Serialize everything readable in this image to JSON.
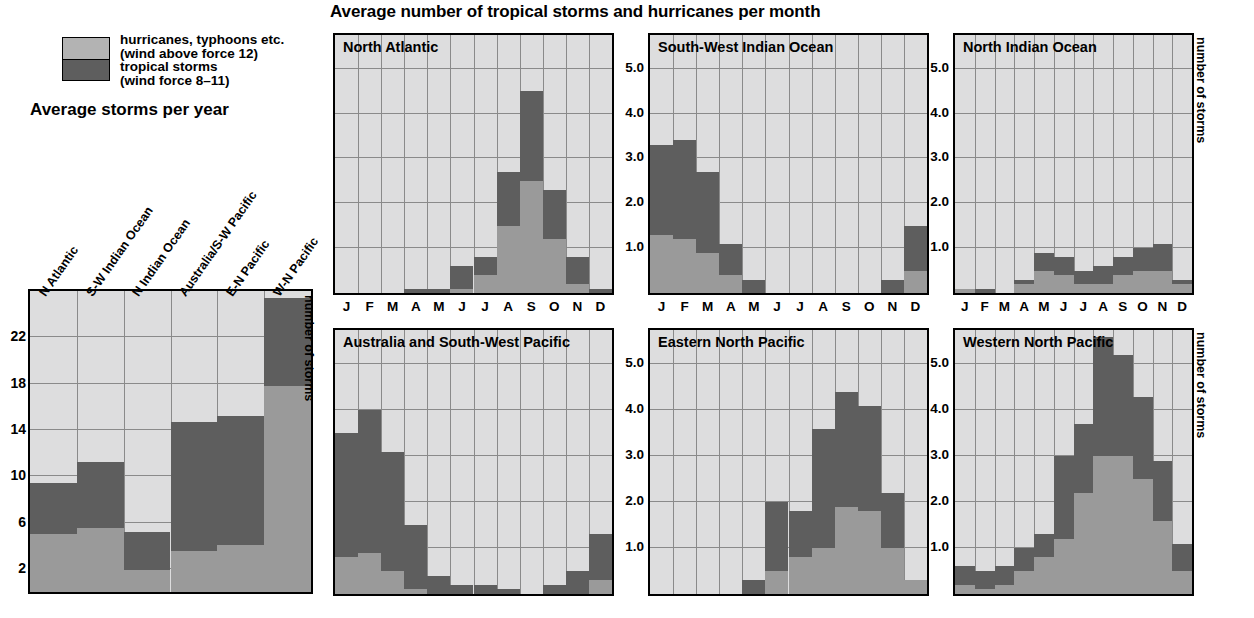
{
  "title": "Average number of tropical storms and hurricanes per month",
  "legend": {
    "items": [
      {
        "label_line1": "hurricanes, typhoons etc.",
        "label_line2": "(wind above force 12)",
        "color": "#b3b3b3",
        "key": "hurricanes"
      },
      {
        "label_line1": "tropical storms",
        "label_line2": "(wind force 8–11)",
        "color": "#5e5e5e",
        "key": "storms"
      }
    ]
  },
  "left_chart_title": "Average storms per year",
  "axis_label_right": "number of storms",
  "months": [
    "J",
    "F",
    "M",
    "A",
    "M",
    "J",
    "J",
    "A",
    "S",
    "O",
    "N",
    "D"
  ],
  "chart_data": [
    {
      "type": "bar",
      "title": "Average storms per year",
      "subtype": "stacked-bar",
      "xlabel": "",
      "ylabel": "number of storms",
      "ylim": [
        0,
        26
      ],
      "yticks": [
        2,
        6,
        10,
        14,
        18,
        22
      ],
      "grid": true,
      "categories": [
        "N Atlantic",
        "S-W Indian Ocean",
        "N Indian Ocean",
        "Australia/S-W Pacific",
        "E-N Pacific",
        "W-N Pacific"
      ],
      "series": [
        {
          "name": "hurricanes, typhoons etc. (wind above force 12)",
          "color": "#9a9a9a",
          "values": [
            5.0,
            5.5,
            1.9,
            3.5,
            4.1,
            17.8
          ]
        },
        {
          "name": "tropical storms (wind force 8-11)",
          "color": "#5e5e5e",
          "values": [
            4.4,
            5.7,
            3.3,
            11.2,
            11.1,
            7.6
          ]
        }
      ],
      "totals": [
        9.4,
        11.2,
        5.2,
        14.7,
        15.2,
        25.4
      ]
    },
    {
      "type": "bar",
      "subtype": "stacked-bar",
      "title": "North Atlantic",
      "xlabel": "",
      "ylabel": "number of storms",
      "ylim": [
        0,
        5.75
      ],
      "yticks": [
        1.0,
        2.0,
        3.0,
        4.0,
        5.0
      ],
      "grid": true,
      "categories": [
        "J",
        "F",
        "M",
        "A",
        "M",
        "J",
        "J",
        "A",
        "S",
        "O",
        "N",
        "D"
      ],
      "series": [
        {
          "name": "hurricanes, typhoons etc. (wind above force 12)",
          "color": "#9a9a9a",
          "values": [
            0.0,
            0.0,
            0.0,
            0.0,
            0.0,
            0.1,
            0.4,
            1.5,
            2.5,
            1.2,
            0.2,
            0.0
          ]
        },
        {
          "name": "tropical storms (wind force 8-11)",
          "color": "#5e5e5e",
          "values": [
            0.0,
            0.0,
            0.0,
            0.1,
            0.1,
            0.5,
            0.4,
            1.2,
            2.0,
            1.1,
            0.6,
            0.1
          ]
        }
      ],
      "totals": [
        0.0,
        0.0,
        0.0,
        0.1,
        0.1,
        0.6,
        0.8,
        2.7,
        4.5,
        2.3,
        0.8,
        0.1
      ]
    },
    {
      "type": "bar",
      "subtype": "stacked-bar",
      "title": "South-West Indian Ocean",
      "xlabel": "",
      "ylabel": "number of storms",
      "ylim": [
        0,
        5.75
      ],
      "yticks": [
        1.0,
        2.0,
        3.0,
        4.0,
        5.0
      ],
      "grid": true,
      "categories": [
        "J",
        "F",
        "M",
        "A",
        "M",
        "J",
        "J",
        "A",
        "S",
        "O",
        "N",
        "D"
      ],
      "series": [
        {
          "name": "hurricanes, typhoons etc. (wind above force 12)",
          "color": "#9a9a9a",
          "values": [
            1.3,
            1.2,
            0.9,
            0.4,
            0.0,
            0.0,
            0.0,
            0.0,
            0.0,
            0.0,
            0.0,
            0.5
          ]
        },
        {
          "name": "tropical storms (wind force 8-11)",
          "color": "#5e5e5e",
          "values": [
            2.0,
            2.2,
            1.8,
            0.7,
            0.3,
            0.0,
            0.0,
            0.0,
            0.0,
            0.0,
            0.3,
            1.0
          ]
        }
      ],
      "totals": [
        3.3,
        3.4,
        2.7,
        1.1,
        0.3,
        0.0,
        0.0,
        0.0,
        0.0,
        0.0,
        0.3,
        1.5
      ]
    },
    {
      "type": "bar",
      "subtype": "stacked-bar",
      "title": "North Indian Ocean",
      "xlabel": "",
      "ylabel": "number of storms",
      "ylim": [
        0,
        5.75
      ],
      "yticks": [
        1.0,
        2.0,
        3.0,
        4.0,
        5.0
      ],
      "grid": true,
      "categories": [
        "J",
        "F",
        "M",
        "A",
        "M",
        "J",
        "J",
        "A",
        "S",
        "O",
        "N",
        "D"
      ],
      "series": [
        {
          "name": "hurricanes, typhoons etc. (wind above force 12)",
          "color": "#9a9a9a",
          "values": [
            0.1,
            0.0,
            0.0,
            0.2,
            0.5,
            0.4,
            0.2,
            0.2,
            0.4,
            0.5,
            0.5,
            0.2
          ]
        },
        {
          "name": "tropical storms (wind force 8-11)",
          "color": "#5e5e5e",
          "values": [
            0.0,
            0.1,
            0.0,
            0.1,
            0.4,
            0.4,
            0.3,
            0.4,
            0.4,
            0.5,
            0.6,
            0.1
          ]
        }
      ],
      "totals": [
        0.1,
        0.1,
        0.0,
        0.3,
        0.9,
        0.8,
        0.5,
        0.6,
        0.8,
        1.0,
        1.1,
        0.3
      ]
    },
    {
      "type": "bar",
      "subtype": "stacked-bar",
      "title": "Australia and South-West Pacific",
      "xlabel": "",
      "ylabel": "number of storms",
      "ylim": [
        0,
        5.75
      ],
      "yticks": [
        1.0,
        2.0,
        3.0,
        4.0,
        5.0
      ],
      "grid": true,
      "categories": [
        "J",
        "F",
        "M",
        "A",
        "M",
        "J",
        "J",
        "A",
        "S",
        "O",
        "N",
        "D"
      ],
      "series": [
        {
          "name": "hurricanes, typhoons etc. (wind above force 12)",
          "color": "#9a9a9a",
          "values": [
            0.8,
            0.9,
            0.5,
            0.1,
            0.0,
            0.0,
            0.0,
            0.0,
            0.0,
            0.0,
            0.0,
            0.3
          ]
        },
        {
          "name": "tropical storms (wind force 8-11)",
          "color": "#5e5e5e",
          "values": [
            2.7,
            3.1,
            2.6,
            1.4,
            0.4,
            0.2,
            0.2,
            0.1,
            0.0,
            0.2,
            0.5,
            1.0
          ]
        }
      ],
      "totals": [
        3.5,
        4.0,
        3.1,
        1.5,
        0.4,
        0.2,
        0.2,
        0.1,
        0.0,
        0.2,
        0.5,
        1.3
      ]
    },
    {
      "type": "bar",
      "subtype": "stacked-bar",
      "title": "Eastern North Pacific",
      "xlabel": "",
      "ylabel": "number of storms",
      "ylim": [
        0,
        5.75
      ],
      "yticks": [
        1.0,
        2.0,
        3.0,
        4.0,
        5.0
      ],
      "grid": true,
      "categories": [
        "J",
        "F",
        "M",
        "A",
        "M",
        "J",
        "J",
        "A",
        "S",
        "O",
        "N",
        "D"
      ],
      "series": [
        {
          "name": "hurricanes, typhoons etc. (wind above force 12)",
          "color": "#9a9a9a",
          "values": [
            0.0,
            0.0,
            0.0,
            0.0,
            0.0,
            0.5,
            0.8,
            1.0,
            1.9,
            1.8,
            1.0,
            0.3
          ]
        },
        {
          "name": "tropical storms (wind force 8-11)",
          "color": "#5e5e5e",
          "values": [
            0.0,
            0.0,
            0.0,
            0.0,
            0.3,
            1.5,
            1.0,
            2.6,
            2.5,
            2.3,
            1.2,
            0.0
          ]
        }
      ],
      "totals": [
        0.0,
        0.0,
        0.0,
        0.0,
        0.3,
        2.0,
        1.8,
        3.6,
        4.4,
        4.1,
        2.2,
        0.3
      ]
    },
    {
      "type": "bar",
      "subtype": "stacked-bar",
      "title": "Western North Pacific",
      "xlabel": "",
      "ylabel": "number of storms",
      "ylim": [
        0,
        5.75
      ],
      "yticks": [
        1.0,
        2.0,
        3.0,
        4.0,
        5.0
      ],
      "grid": true,
      "categories": [
        "J",
        "F",
        "M",
        "A",
        "M",
        "J",
        "J",
        "A",
        "S",
        "O",
        "N",
        "D"
      ],
      "series": [
        {
          "name": "hurricanes, typhoons etc. (wind above force 12)",
          "color": "#9a9a9a",
          "values": [
            0.2,
            0.1,
            0.2,
            0.5,
            0.8,
            1.2,
            2.2,
            3.0,
            3.0,
            2.5,
            1.6,
            0.5
          ]
        },
        {
          "name": "tropical storms (wind force 8-11)",
          "color": "#5e5e5e",
          "values": [
            0.4,
            0.4,
            0.4,
            0.5,
            0.5,
            1.8,
            1.5,
            2.6,
            2.2,
            1.8,
            1.3,
            0.6
          ]
        }
      ],
      "totals": [
        0.6,
        0.5,
        0.6,
        1.0,
        1.3,
        3.0,
        3.7,
        5.6,
        5.2,
        4.3,
        2.9,
        1.1
      ]
    }
  ]
}
